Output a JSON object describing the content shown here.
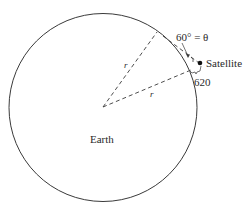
{
  "diagram": {
    "type": "geometry",
    "labels": {
      "earth": "Earth",
      "satellite": "Satellite",
      "angle": "60° = θ",
      "radius_upper": "r",
      "radius_lower": "r",
      "altitude": "620"
    },
    "values": {
      "angle_degrees": 60,
      "angle_symbol": "θ",
      "altitude": 620
    },
    "colors": {
      "line": "#3a3a3a",
      "background": "#ffffff",
      "satellite": "#111111"
    }
  }
}
